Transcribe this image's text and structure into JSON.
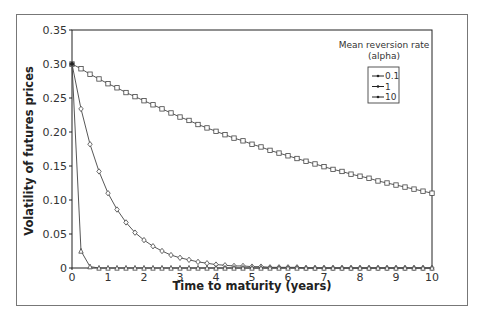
{
  "chart_data": {
    "type": "line",
    "title": "",
    "xlabel": "Time to maturity (years)",
    "ylabel": "Volatility of futures prices",
    "xlim": [
      0,
      10
    ],
    "ylim": [
      0,
      0.35
    ],
    "x_ticks": [
      "0",
      "1",
      "2",
      "3",
      "4",
      "5",
      "6",
      "7",
      "8",
      "9",
      "10"
    ],
    "y_ticks": [
      "0",
      "0.05",
      "0.10",
      "0.15",
      "0.20",
      "0.25",
      "0.30",
      "0.35"
    ],
    "grid": false,
    "legend": {
      "title_line1": "Mean reversion rate",
      "title_line2": "(alpha)",
      "position": "upper right",
      "entries": [
        "0.1",
        "1",
        "10"
      ]
    },
    "x": [
      0,
      0.25,
      0.5,
      0.75,
      1,
      1.25,
      1.5,
      1.75,
      2,
      2.25,
      2.5,
      2.75,
      3,
      3.25,
      3.5,
      3.75,
      4,
      4.25,
      4.5,
      4.75,
      5,
      5.25,
      5.5,
      5.75,
      6,
      6.25,
      6.5,
      6.75,
      7,
      7.25,
      7.5,
      7.75,
      8,
      8.25,
      8.5,
      8.75,
      9,
      9.25,
      9.5,
      9.75,
      10
    ],
    "series": [
      {
        "name": "0.1",
        "marker": "square",
        "values": [
          0.3,
          0.293,
          0.285,
          0.278,
          0.271,
          0.265,
          0.258,
          0.252,
          0.246,
          0.24,
          0.234,
          0.228,
          0.222,
          0.217,
          0.211,
          0.206,
          0.201,
          0.196,
          0.191,
          0.187,
          0.182,
          0.178,
          0.173,
          0.169,
          0.165,
          0.161,
          0.157,
          0.153,
          0.149,
          0.145,
          0.142,
          0.138,
          0.135,
          0.132,
          0.128,
          0.125,
          0.122,
          0.119,
          0.116,
          0.113,
          0.11
        ]
      },
      {
        "name": "1",
        "marker": "diamond",
        "values": [
          0.3,
          0.234,
          0.182,
          0.142,
          0.11,
          0.086,
          0.067,
          0.052,
          0.041,
          0.032,
          0.025,
          0.019,
          0.015,
          0.012,
          0.009,
          0.007,
          0.005,
          0.004,
          0.003,
          0.003,
          0.002,
          0.002,
          0.001,
          0.001,
          0.001,
          0.001,
          0.0,
          0.0,
          0.0,
          0.0,
          0.0,
          0.0,
          0.0,
          0.0,
          0.0,
          0.0,
          0.0,
          0.0,
          0.0,
          0.0,
          0.0
        ]
      },
      {
        "name": "10",
        "marker": "triangle",
        "values": [
          0.3,
          0.025,
          0.002,
          0.0,
          0.0,
          0.0,
          0.0,
          0.0,
          0.0,
          0.0,
          0.0,
          0.0,
          0.0,
          0.0,
          0.0,
          0.0,
          0.0,
          0.0,
          0.0,
          0.0,
          0.0,
          0.0,
          0.0,
          0.0,
          0.0,
          0.0,
          0.0,
          0.0,
          0.0,
          0.0,
          0.0,
          0.0,
          0.0,
          0.0,
          0.0,
          0.0,
          0.0,
          0.0,
          0.0,
          0.0,
          0.0
        ]
      }
    ]
  },
  "colors": {
    "line": "#444444",
    "axis": "#222222",
    "frame": "#777777",
    "marker_fill": "#ffffff"
  }
}
